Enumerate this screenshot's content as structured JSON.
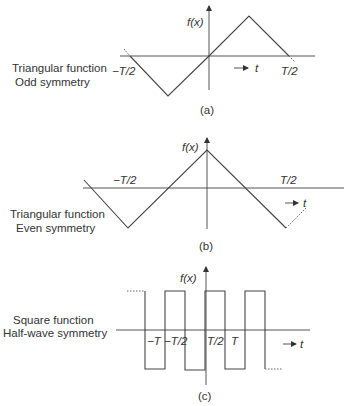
{
  "panels": [
    {
      "id": "a",
      "caption": "(a)",
      "description_lines": [
        "Triangular function",
        "Odd symmetry"
      ],
      "y_label": "f(x)",
      "x_label": "t",
      "tick_labels": {
        "left": "−T/2",
        "right": "T/2"
      }
    },
    {
      "id": "b",
      "caption": "(b)",
      "description_lines": [
        "Triangular function",
        "Even symmetry"
      ],
      "y_label": "f(x)",
      "x_label": "t",
      "tick_labels": {
        "left": "−T/2",
        "right": "T/2"
      }
    },
    {
      "id": "c",
      "caption": "(c)",
      "description_lines": [
        "Square function",
        "Half-wave symmetry"
      ],
      "y_label": "f(x)",
      "x_label": "t",
      "tick_labels": {
        "neg_T": "−T",
        "neg_half": "−T/2",
        "pos_half": "T/2",
        "pos_T": "T"
      }
    }
  ]
}
